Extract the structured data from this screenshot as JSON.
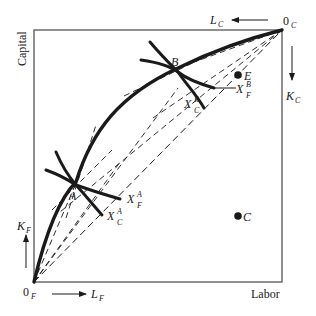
{
  "figure": {
    "type": "edgeworth-box-production",
    "axis_labels": {
      "vertical": "Capital",
      "horizontal": "Labor"
    },
    "origins": {
      "food": {
        "base": "0",
        "sub": "F"
      },
      "clothing": {
        "base": "0",
        "sub": "C"
      }
    },
    "direction_labels": {
      "labor_food": {
        "base": "L",
        "sub": "F"
      },
      "capital_food": {
        "base": "K",
        "sub": "F"
      },
      "labor_clothing": {
        "base": "L",
        "sub": "C"
      },
      "capital_clothing": {
        "base": "K",
        "sub": "C"
      }
    },
    "points": [
      {
        "id": "A",
        "label": "A"
      },
      {
        "id": "B",
        "label": "B"
      },
      {
        "id": "C",
        "label": "C"
      },
      {
        "id": "E",
        "label": "E"
      }
    ],
    "isoquants": [
      {
        "id": "XFA",
        "base": "X",
        "sub": "F",
        "sup": "A"
      },
      {
        "id": "XCA",
        "base": "X",
        "sub": "C",
        "sup": "A"
      },
      {
        "id": "XFB",
        "base": "X",
        "sub": "F",
        "sup": "B"
      },
      {
        "id": "XCB",
        "base": "X",
        "sub": "C",
        "sup": "B"
      }
    ],
    "colors": {
      "ink": "#1a1a1a",
      "frame": "#555555",
      "background": "#ffffff"
    }
  }
}
